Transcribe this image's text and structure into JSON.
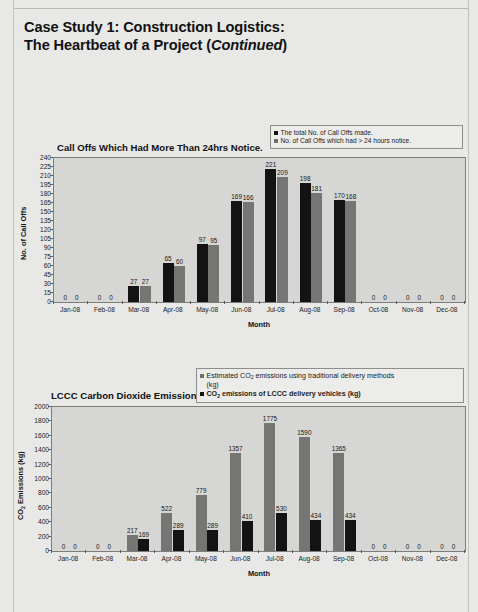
{
  "document": {
    "heading_line1": "Case Study 1: Construction Logistics:",
    "heading_line2_prefix": "The Heartbeat of a Project (",
    "heading_line2_italic": "Continued",
    "heading_line2_suffix": ")"
  },
  "colors": {
    "series_black": "#131313",
    "series_gray": "#757573",
    "plot_background": "#d6d6d4",
    "page_background": "#e8e8e6",
    "axis": "#5d5d5b"
  },
  "chart_data": [
    {
      "type": "bar",
      "title": "Call Offs Which Had More Than 24hrs Notice.",
      "xlabel": "Month",
      "ylabel": "No. of Call Offs",
      "ylim": [
        0,
        240
      ],
      "ytick_step": 15,
      "yticks": [
        0,
        15,
        30,
        45,
        60,
        75,
        90,
        105,
        120,
        135,
        150,
        165,
        180,
        195,
        210,
        225,
        240
      ],
      "grid": false,
      "legend_position": "top-right",
      "categories": [
        "Jan-08",
        "Feb-08",
        "Mar-08",
        "Apr-08",
        "May-08",
        "Jun-08",
        "Jul-08",
        "Aug-08",
        "Sep-08",
        "Oct-08",
        "Nov-08",
        "Dec-08"
      ],
      "series": [
        {
          "name": "The total No. of Call Offs made.",
          "color": "#131313",
          "values": [
            0,
            0,
            27,
            65,
            97,
            169,
            221,
            198,
            170,
            0,
            0,
            0
          ]
        },
        {
          "name": "No. of Call Offs which had > 24 hours notice.",
          "color": "#757573",
          "values": [
            0,
            0,
            27,
            60,
            95,
            166,
            209,
            181,
            168,
            0,
            0,
            0
          ]
        }
      ]
    },
    {
      "type": "bar",
      "title": "LCCC Carbon Dioxide Emissions",
      "xlabel": "Month",
      "ylabel": "CO2 Emissions (kg)",
      "ylim": [
        0,
        2000
      ],
      "ytick_step": 200,
      "yticks": [
        0,
        200,
        400,
        600,
        800,
        1000,
        1200,
        1400,
        1600,
        1800,
        2000
      ],
      "grid": false,
      "legend_position": "top-right",
      "categories": [
        "Jan-08",
        "Feb-08",
        "Mar-08",
        "Apr-08",
        "May-08",
        "Jun-08",
        "Jul-08",
        "Aug-08",
        "Sep-08",
        "Oct-08",
        "Nov-08",
        "Dec-08"
      ],
      "series": [
        {
          "name": "Estimated CO2 emissions using traditional delivery methods (kg)",
          "color": "#757573",
          "values": [
            0,
            0,
            217,
            522,
            779,
            1357,
            1775,
            1590,
            1365,
            0,
            0,
            0
          ]
        },
        {
          "name": "CO2 emissions of LCCC delivery vehicles (kg)",
          "color": "#131313",
          "values": [
            0,
            0,
            169,
            289,
            289,
            410,
            530,
            434,
            434,
            0,
            0,
            0
          ]
        }
      ]
    }
  ],
  "chart1_legend": {
    "item1": "The total No. of Call Offs made.",
    "item2": "No. of Call Offs which had > 24 hours notice."
  },
  "chart2_legend": {
    "item1_a": "Estimated CO",
    "item1_sub": "2",
    "item1_b": " emissions using traditional delivery methods",
    "item1_c": "(kg)",
    "item2_a": "CO",
    "item2_sub": "2",
    "item2_b": " emissions of LCCC delivery vehicles (kg)"
  },
  "chart1_axis": {
    "ylabel": "No. of Call Offs",
    "xlabel": "Month",
    "title": "Call Offs Which Had More Than 24hrs Notice."
  },
  "chart2_axis": {
    "ylabel_a": "CO",
    "ylabel_sub": "2",
    "ylabel_b": " Emissions (kg)",
    "xlabel": "Month",
    "title": "LCCC Carbon Dioxide Emissions"
  }
}
